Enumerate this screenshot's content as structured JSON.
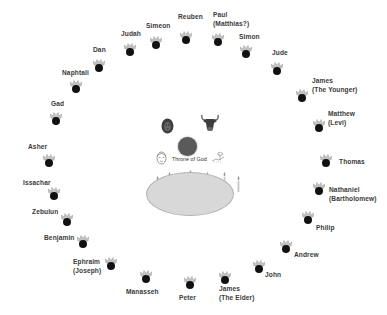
{
  "diagram": {
    "center": {
      "throne_label": "Throne of God",
      "creatures": [
        "lion-icon",
        "ox-icon",
        "man-icon",
        "eagle-icon"
      ],
      "sea": "sea-of-glass",
      "lamps_count": 7
    },
    "tribes": [
      {
        "name": "Reuben",
        "line2": ""
      },
      {
        "name": "Simeon",
        "line2": ""
      },
      {
        "name": "Judah",
        "line2": ""
      },
      {
        "name": "Dan",
        "line2": ""
      },
      {
        "name": "Naphtali",
        "line2": ""
      },
      {
        "name": "Gad",
        "line2": ""
      },
      {
        "name": "Asher",
        "line2": ""
      },
      {
        "name": "Issachar",
        "line2": ""
      },
      {
        "name": "Zebulun",
        "line2": ""
      },
      {
        "name": "Benjamin",
        "line2": ""
      },
      {
        "name": "Ephraim",
        "line2": "(Joseph)"
      },
      {
        "name": "Manasseh",
        "line2": ""
      }
    ],
    "apostles": [
      {
        "name": "Paul",
        "line2": "(Matthias?)"
      },
      {
        "name": "Simon",
        "line2": ""
      },
      {
        "name": "Jude",
        "line2": ""
      },
      {
        "name": "James",
        "line2": "(The Younger)"
      },
      {
        "name": "Matthew",
        "line2": "(Levi)"
      },
      {
        "name": "Thomas",
        "line2": ""
      },
      {
        "name": "Nathaniel",
        "line2": "(Bartholomew)"
      },
      {
        "name": "Philip",
        "line2": ""
      },
      {
        "name": "Andrew",
        "line2": ""
      },
      {
        "name": "John",
        "line2": ""
      },
      {
        "name": "James",
        "line2": "(The Elder)"
      },
      {
        "name": "Peter",
        "line2": ""
      }
    ],
    "colors": {
      "head": "#111111",
      "crown": "#b8b8b8",
      "throne": "#5a5a5a",
      "sea": "#d8d8d8",
      "text": "#3a3a3a"
    }
  }
}
